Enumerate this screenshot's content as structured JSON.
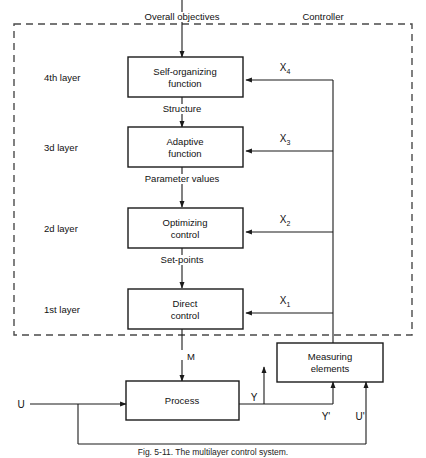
{
  "figure": {
    "caption": "Fig. 5-11.  The multilayer control system.",
    "zone_label": "Controller",
    "top_input_label": "Overall objectives"
  },
  "layers": [
    {
      "name": "4th layer",
      "block": "Self-organizing\nfunction",
      "block_line1": "Self-organizing",
      "block_line2": "function",
      "signal": "X",
      "subscript": "4",
      "output_label": "Structure"
    },
    {
      "name": "3d  layer",
      "block_line1": "Adaptive",
      "block_line2": "function",
      "signal": "X",
      "subscript": "3",
      "output_label": "Parameter values"
    },
    {
      "name": "2d  layer",
      "block_line1": "Optimizing",
      "block_line2": "control",
      "signal": "X",
      "subscript": "2",
      "output_label": "Set-points"
    },
    {
      "name": "1st  layer",
      "block_line1": "Direct",
      "block_line2": "control",
      "signal": "X",
      "subscript": "1",
      "output_label": "M"
    }
  ],
  "plant": {
    "process_label": "Process",
    "measuring_line1": "Measuring",
    "measuring_line2": "elements",
    "input_label": "U",
    "output_label": "Y",
    "measured_output_label": "Y'",
    "measured_input_label": "U'"
  },
  "colors": {
    "line": "#1a1a1a",
    "dashed": "#4a4a4a",
    "text": "#111111",
    "background": "#ffffff"
  }
}
